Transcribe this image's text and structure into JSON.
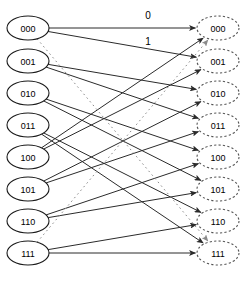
{
  "diagram": {
    "left_column": {
      "name": "current-states",
      "node_style": "solid-ellipse",
      "nodes": [
        {
          "id": "L000",
          "label": "000",
          "cx": 28,
          "cy": 28
        },
        {
          "id": "L001",
          "label": "001",
          "cx": 28,
          "cy": 61
        },
        {
          "id": "L010",
          "label": "010",
          "cx": 28,
          "cy": 93
        },
        {
          "id": "L011",
          "label": "011",
          "cx": 28,
          "cy": 125
        },
        {
          "id": "L100",
          "label": "100",
          "cx": 28,
          "cy": 157
        },
        {
          "id": "L101",
          "label": "101",
          "cx": 28,
          "cy": 189
        },
        {
          "id": "L110",
          "label": "110",
          "cx": 28,
          "cy": 221
        },
        {
          "id": "L111",
          "label": "111",
          "cx": 28,
          "cy": 253
        }
      ]
    },
    "right_column": {
      "name": "next-states",
      "node_style": "dashed-ellipse",
      "nodes": [
        {
          "id": "R000",
          "label": "000",
          "cx": 218,
          "cy": 28
        },
        {
          "id": "R001",
          "label": "001",
          "cx": 218,
          "cy": 61
        },
        {
          "id": "R010",
          "label": "010",
          "cx": 218,
          "cy": 93
        },
        {
          "id": "R011",
          "label": "011",
          "cx": 218,
          "cy": 125
        },
        {
          "id": "R100",
          "label": "100",
          "cx": 218,
          "cy": 157
        },
        {
          "id": "R101",
          "label": "101",
          "cx": 218,
          "cy": 189
        },
        {
          "id": "R110",
          "label": "110",
          "cx": 218,
          "cy": 221
        },
        {
          "id": "R111",
          "label": "111",
          "cx": 218,
          "cy": 253
        }
      ]
    },
    "node_size": {
      "rx": 21,
      "ry": 12
    },
    "edges": [
      {
        "from": "L000",
        "to": "R000",
        "style": "solid",
        "label": "0"
      },
      {
        "from": "L000",
        "to": "R001",
        "style": "solid",
        "label": "1"
      },
      {
        "from": "L001",
        "to": "R010",
        "style": "solid",
        "label": ""
      },
      {
        "from": "L001",
        "to": "R011",
        "style": "solid",
        "label": ""
      },
      {
        "from": "L010",
        "to": "R100",
        "style": "solid",
        "label": ""
      },
      {
        "from": "L010",
        "to": "R101",
        "style": "solid",
        "label": ""
      },
      {
        "from": "L011",
        "to": "R110",
        "style": "solid",
        "label": ""
      },
      {
        "from": "L011",
        "to": "R111",
        "style": "solid",
        "label": ""
      },
      {
        "from": "L100",
        "to": "R000",
        "style": "solid",
        "label": ""
      },
      {
        "from": "L100",
        "to": "R001",
        "style": "solid",
        "label": ""
      },
      {
        "from": "L101",
        "to": "R010",
        "style": "solid",
        "label": ""
      },
      {
        "from": "L101",
        "to": "R011",
        "style": "solid",
        "label": ""
      },
      {
        "from": "L110",
        "to": "R100",
        "style": "solid",
        "label": ""
      },
      {
        "from": "L110",
        "to": "R101",
        "style": "solid",
        "label": ""
      },
      {
        "from": "L111",
        "to": "R110",
        "style": "solid",
        "label": ""
      },
      {
        "from": "L111",
        "to": "R111",
        "style": "solid",
        "label": ""
      },
      {
        "from": "L000",
        "to": "R111",
        "style": "dotted",
        "label": ""
      },
      {
        "from": "L111",
        "to": "R000",
        "style": "dotted",
        "label": ""
      }
    ],
    "edge_labels": [
      {
        "name": "edge-label-zero",
        "text": "0",
        "x": 148,
        "y": 15
      },
      {
        "name": "edge-label-one",
        "text": "1",
        "x": 148,
        "y": 41
      }
    ],
    "colors": {
      "edge_solid": "#2b2b2b",
      "edge_dotted": "#8a8a8a",
      "node_left_stroke": "#1a1a1a",
      "node_right_stroke": "#555555",
      "background": "#ffffff",
      "text": "#000000"
    }
  }
}
